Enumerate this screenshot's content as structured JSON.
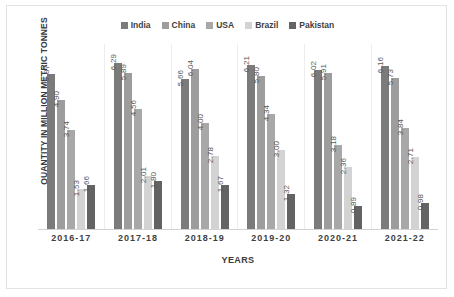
{
  "chart_data": {
    "type": "bar",
    "title": "",
    "xlabel": "YEARS",
    "ylabel": "QUANTITY IN MILLION METRIC TONNES",
    "categories": [
      "2016-17",
      "2017-18",
      "2018-19",
      "2019-20",
      "2020-21",
      "2021-22"
    ],
    "ylim": [
      0,
      7
    ],
    "grid": false,
    "legend_position": "top-center",
    "series": [
      {
        "name": "India",
        "color": "#7b7b7b",
        "values": [
          5.87,
          6.29,
          5.66,
          6.21,
          6.02,
          6.16
        ],
        "labels": [
          "5.87",
          "6.29",
          "5.66",
          "6.21",
          "6.02",
          "6.16"
        ]
      },
      {
        "name": "China",
        "color": "#9d9d9d",
        "values": [
          4.9,
          5.89,
          6.04,
          5.8,
          5.91,
          5.73
        ],
        "labels": [
          "4.90",
          "5.89",
          "6.04",
          "5.80",
          "5.91",
          "5.73"
        ]
      },
      {
        "name": "USA",
        "color": "#a8a8a8",
        "values": [
          3.74,
          4.56,
          4.0,
          4.34,
          3.18,
          3.84
        ],
        "labels": [
          "3.74",
          "4.56",
          "4.00",
          "4.34",
          "3.18",
          "3.84"
        ]
      },
      {
        "name": "Brazil",
        "color": "#d3d3d3",
        "values": [
          1.53,
          2.01,
          2.78,
          3.0,
          2.36,
          2.71
        ],
        "labels": [
          "1.53",
          "2.01",
          "2.78",
          "3.00",
          "2.36",
          "2.71"
        ]
      },
      {
        "name": "Pakistan",
        "color": "#636363",
        "values": [
          1.66,
          1.8,
          1.67,
          1.32,
          0.89,
          0.98
        ],
        "labels": [
          "1.66",
          "1.80",
          "1.67",
          "1.32",
          "0.89",
          "0.98"
        ]
      }
    ]
  }
}
